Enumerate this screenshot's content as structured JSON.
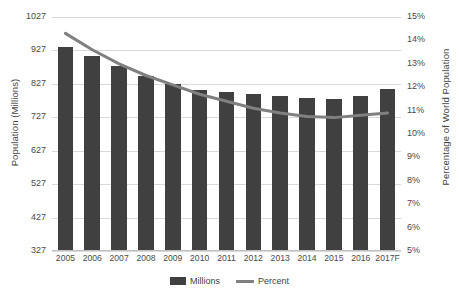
{
  "chart_data": {
    "type": "bar",
    "title": "",
    "xlabel": "",
    "ylabel": "Population (Millions)",
    "y2label": "Percentage of World Population",
    "categories": [
      "2005",
      "2006",
      "2007",
      "2008",
      "2009",
      "2010",
      "2011",
      "2012",
      "2013",
      "2014",
      "2015",
      "2016",
      "2017F"
    ],
    "ylim": [
      327,
      1027
    ],
    "y2lim": [
      5,
      15
    ],
    "yticks": [
      "1027",
      "927",
      "827",
      "727",
      "627",
      "527",
      "427",
      "327"
    ],
    "ytick_values": [
      1027,
      927,
      827,
      727,
      627,
      527,
      427,
      327
    ],
    "y2ticks": [
      "15%",
      "14%",
      "13%",
      "12%",
      "11%",
      "10%",
      "9%",
      "8%",
      "7%",
      "6%",
      "5%"
    ],
    "y2tick_values": [
      15,
      14,
      13,
      12,
      11,
      10,
      9,
      8,
      7,
      6,
      5
    ],
    "grid": true,
    "legend_position": "bottom",
    "series": [
      {
        "name": "Millions",
        "type": "bar",
        "axis": "left",
        "color": "#404040",
        "values": [
          938,
          910,
          880,
          850,
          828,
          808,
          802,
          797,
          790,
          785,
          782,
          790,
          812
        ]
      },
      {
        "name": "Percent",
        "type": "line",
        "axis": "right",
        "color": "#808080",
        "values": [
          14.3,
          13.6,
          13.0,
          12.5,
          12.1,
          11.7,
          11.4,
          11.1,
          10.9,
          10.75,
          10.7,
          10.8,
          10.9
        ]
      }
    ]
  },
  "axis": {
    "left_title": "Population (Millions)",
    "right_title": "Percentage of World Population"
  },
  "legend": {
    "items": [
      {
        "label": "Millions",
        "marker": "bar-swatch",
        "color": "#404040"
      },
      {
        "label": "Percent",
        "marker": "line-swatch",
        "color": "#808080"
      }
    ]
  }
}
